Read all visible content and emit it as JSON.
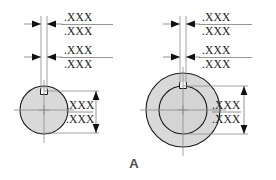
{
  "figure": {
    "caption": "A",
    "background_color": "#ffffff",
    "part_fill_color": "#d9d9d9",
    "outline_color": "#1a1a1a",
    "dimension_line_color": "#7a7a7a",
    "dimension_text_color": "#1a1a1a"
  },
  "views": [
    {
      "id": "left-view",
      "name": "solid-shaft-keyway-view",
      "shape": "circle-with-top-keyway-notch",
      "dimensions": [
        {
          "id": "left-horizontal-top",
          "orientation": "horizontal",
          "arrow_direction": "inward",
          "upper_value": ".XXX",
          "lower_value": ".XXX"
        },
        {
          "id": "left-horizontal-lower",
          "orientation": "horizontal",
          "arrow_direction": "inward",
          "upper_value": ".XXX",
          "lower_value": ".XXX"
        },
        {
          "id": "left-vertical",
          "orientation": "vertical",
          "arrow_direction": "outward",
          "upper_value": ".XXX",
          "lower_value": ".XXX"
        }
      ]
    },
    {
      "id": "right-view",
      "name": "hollow-bore-keyway-view",
      "shape": "annulus-with-top-keyway-notch",
      "dimensions": [
        {
          "id": "right-horizontal-top",
          "orientation": "horizontal",
          "arrow_direction": "inward",
          "upper_value": ".XXX",
          "lower_value": ".XXX"
        },
        {
          "id": "right-horizontal-lower",
          "orientation": "horizontal",
          "arrow_direction": "inward",
          "upper_value": ".XXX",
          "lower_value": ".XXX"
        },
        {
          "id": "right-vertical",
          "orientation": "vertical",
          "arrow_direction": "inward",
          "upper_value": ".XXX",
          "lower_value": ".XXX"
        }
      ]
    }
  ]
}
